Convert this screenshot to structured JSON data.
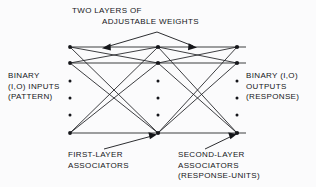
{
  "figure": {
    "type": "neural-network-diagram",
    "title_top": {
      "line1": "TWO LAYERS OF",
      "line2": "ADJUSTABLE WEIGHTS"
    },
    "label_inputs": {
      "line1": "BINARY",
      "line2": "(I,O) INPUTS",
      "line3": "(PATTERN)"
    },
    "label_outputs": {
      "line1": "BINARY (I,O)",
      "line2": "OUTPUTS",
      "line3": "(RESPONSE)"
    },
    "label_first_associators": {
      "line1": "FIRST-LAYER",
      "line2": "ASSOCIATORS"
    },
    "label_second_associators": {
      "line1": "SECOND-LAYER",
      "line2": "ASSOCIATORS",
      "line3": "(RESPONSE-UNITS)"
    },
    "colors": {
      "ink": "#15161a",
      "background": "#fbfbfc"
    },
    "layers": [
      {
        "name": "input-layer",
        "x": 70,
        "node_rows": [
          47,
          63,
          133
        ],
        "ellipsis_rows": [
          81,
          98,
          115
        ],
        "node_count_shown": 3
      },
      {
        "name": "first-layer-associators",
        "x": 158,
        "node_rows": [
          47,
          63,
          133
        ],
        "ellipsis_rows": [
          81,
          98,
          115
        ],
        "node_count_shown": 3
      },
      {
        "name": "second-layer-associators",
        "x": 237,
        "node_rows": [
          47,
          63,
          133
        ],
        "ellipsis_rows": [
          81,
          98,
          115
        ],
        "node_count_shown": 3
      }
    ],
    "annotation_arrows": [
      {
        "name": "weights-arrow-left",
        "from": [
          156,
          33
        ],
        "to": [
          103,
          48
        ]
      },
      {
        "name": "weights-arrow-right",
        "from": [
          156,
          33
        ],
        "to": [
          196,
          48
        ]
      },
      {
        "name": "first-assoc-arrow",
        "from": [
          108,
          151
        ],
        "to": [
          156,
          135
        ]
      },
      {
        "name": "second-assoc-arrow",
        "from": [
          206,
          151
        ],
        "to": [
          236,
          135
        ]
      }
    ]
  }
}
